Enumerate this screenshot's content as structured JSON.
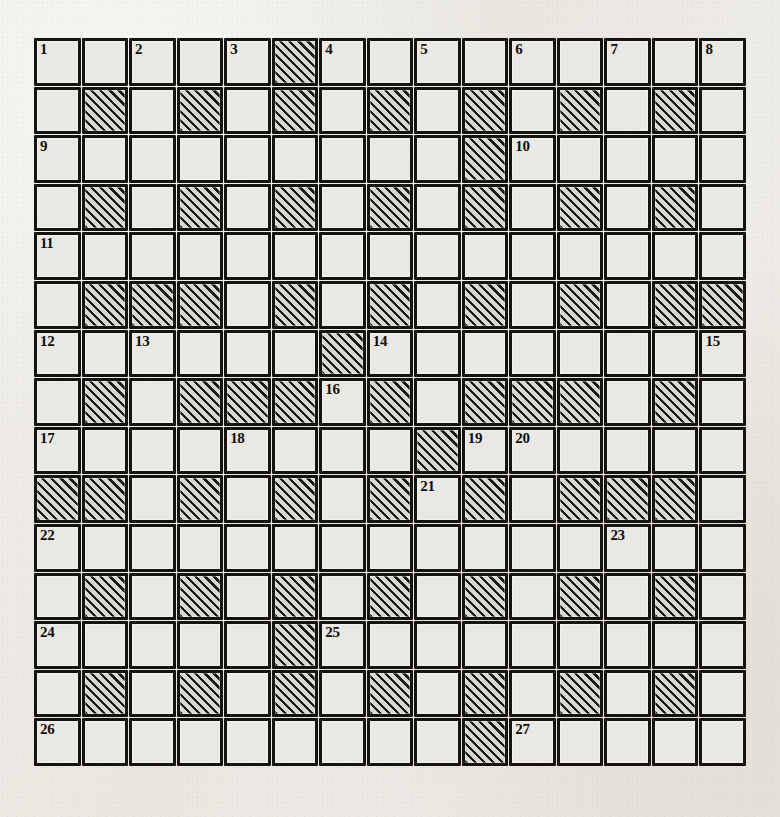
{
  "puzzle": {
    "title": "Crossword Puzzle Grid",
    "rows": 15,
    "columns": 15,
    "colors": {
      "paper": "#eceae4",
      "cell_fill": "#eae8e2",
      "block_fill": "#d9d7d1",
      "ink": "#151310"
    },
    "clue_numbers": [
      {
        "number": "1",
        "row": 1,
        "col": 1
      },
      {
        "number": "2",
        "row": 1,
        "col": 3
      },
      {
        "number": "3",
        "row": 1,
        "col": 5
      },
      {
        "number": "4",
        "row": 1,
        "col": 7
      },
      {
        "number": "5",
        "row": 1,
        "col": 9
      },
      {
        "number": "6",
        "row": 1,
        "col": 11
      },
      {
        "number": "7",
        "row": 1,
        "col": 13
      },
      {
        "number": "8",
        "row": 1,
        "col": 15
      },
      {
        "number": "9",
        "row": 3,
        "col": 1
      },
      {
        "number": "10",
        "row": 3,
        "col": 11
      },
      {
        "number": "11",
        "row": 5,
        "col": 1
      },
      {
        "number": "12",
        "row": 7,
        "col": 1
      },
      {
        "number": "13",
        "row": 7,
        "col": 3
      },
      {
        "number": "14",
        "row": 7,
        "col": 8
      },
      {
        "number": "15",
        "row": 7,
        "col": 15
      },
      {
        "number": "16",
        "row": 8,
        "col": 7
      },
      {
        "number": "17",
        "row": 9,
        "col": 1
      },
      {
        "number": "18",
        "row": 9,
        "col": 5
      },
      {
        "number": "19",
        "row": 9,
        "col": 10
      },
      {
        "number": "20",
        "row": 9,
        "col": 11
      },
      {
        "number": "21",
        "row": 10,
        "col": 9
      },
      {
        "number": "22",
        "row": 11,
        "col": 1
      },
      {
        "number": "23",
        "row": 11,
        "col": 13
      },
      {
        "number": "24",
        "row": 13,
        "col": 1
      },
      {
        "number": "25",
        "row": 13,
        "col": 7
      },
      {
        "number": "26",
        "row": 15,
        "col": 1
      },
      {
        "number": "27",
        "row": 15,
        "col": 11
      }
    ],
    "blocked_cells": [
      {
        "row": 1,
        "cols": [
          6
        ]
      },
      {
        "row": 2,
        "cols": [
          2,
          4,
          6,
          8,
          10,
          12,
          14
        ]
      },
      {
        "row": 3,
        "cols": [
          10
        ]
      },
      {
        "row": 4,
        "cols": [
          2,
          4,
          6,
          8,
          10,
          12,
          14
        ]
      },
      {
        "row": 5,
        "cols": []
      },
      {
        "row": 6,
        "cols": [
          2,
          3,
          4,
          6,
          8,
          10,
          12,
          14,
          15
        ]
      },
      {
        "row": 7,
        "cols": [
          7
        ]
      },
      {
        "row": 8,
        "cols": [
          2,
          4,
          5,
          6,
          8,
          10,
          11,
          12,
          14
        ]
      },
      {
        "row": 9,
        "cols": [
          9
        ]
      },
      {
        "row": 10,
        "cols": [
          1,
          2,
          4,
          6,
          8,
          10,
          12,
          13,
          14
        ]
      },
      {
        "row": 11,
        "cols": []
      },
      {
        "row": 12,
        "cols": [
          2,
          4,
          6,
          8,
          10,
          12,
          14
        ]
      },
      {
        "row": 13,
        "cols": [
          6
        ]
      },
      {
        "row": 14,
        "cols": [
          2,
          4,
          6,
          8,
          10,
          12,
          14
        ]
      },
      {
        "row": 15,
        "cols": [
          10
        ]
      }
    ]
  }
}
